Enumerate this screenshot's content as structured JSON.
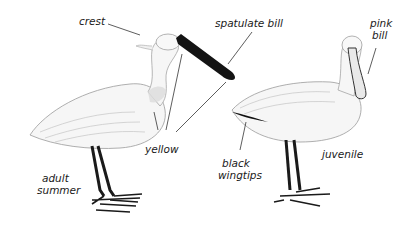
{
  "figure": {
    "birds": [
      {
        "id": "adult",
        "label_lines": [
          "adult",
          "summer"
        ]
      },
      {
        "id": "juvenile",
        "label_lines": [
          "juvenile"
        ]
      }
    ],
    "annotations": {
      "crest": "crest",
      "spatulate_bill": "spatulate bill",
      "pink_bill_1": "pink",
      "pink_bill_2": "bill",
      "yellow": "yellow",
      "black_wingtips_1": "black",
      "black_wingtips_2": "wingtips"
    },
    "colors": {
      "ink": "#1a1a1a",
      "plumage": "#f4f4f4",
      "shade": "#cfcfcf",
      "bill_adult": "#141414",
      "bill_juvenile": "#e9e9e9",
      "background": "#ffffff"
    }
  }
}
